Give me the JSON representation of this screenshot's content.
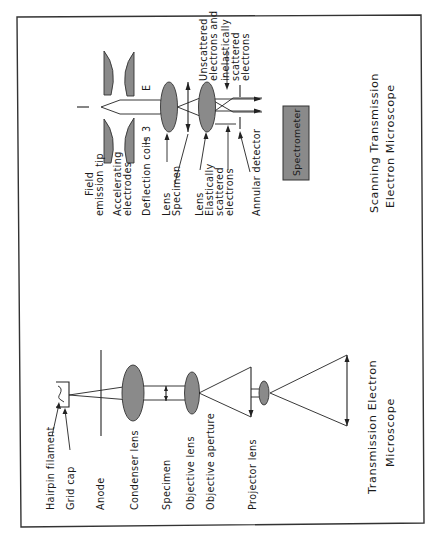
{
  "figure": {
    "orientation": "rotated 90 degrees counterclockwise",
    "frame_color": "#333333",
    "lens_fill": "#8a8a8a",
    "spectrometer_fill": "#8a8a8a"
  },
  "stem": {
    "caption_line1": "Scanning Transmission",
    "caption_line2": "Electron Microscope",
    "labels": {
      "field_line1": "Field",
      "field_line2": "emission tip",
      "accel_line1": "Accelerating",
      "accel_line2": "electrodes",
      "deflection": "Deflection coils",
      "deflection_symbol": "3",
      "lens1": "Lens",
      "specimen": "Specimen",
      "lens2": "Lens",
      "elastic_line1": "Elastically",
      "elastic_line2": "scattered",
      "elastic_line3": "electrons",
      "annular": "Annular detector",
      "unscat_line1": "Unscattered",
      "unscat_line2": "electrons and",
      "unscat_line3": "inelastically",
      "unscat_line4": "scattered",
      "unscat_line5": "electrons",
      "deflection_symbol_top": "E"
    },
    "spectrometer_label": "Spectrometer"
  },
  "tem": {
    "caption_line1": "Transmission Electron",
    "caption_line2": "Microscope",
    "labels": {
      "hairpin": "Hairpin filament",
      "gridcap": "Grid cap",
      "anode": "Anode",
      "condenser": "Condenser lens",
      "specimen": "Specimen",
      "objective_lens": "Objective lens",
      "objective_aperture": "Objective aperture",
      "projector": "Projector lens"
    }
  }
}
